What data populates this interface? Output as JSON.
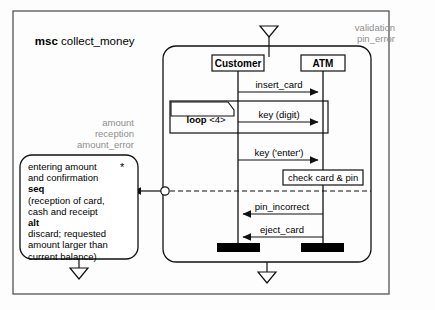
{
  "diagram": {
    "type": "message-sequence-chart",
    "keyword": "msc",
    "name": "collect_money",
    "title_full": "msc collect_money"
  },
  "gates": {
    "top_right_labels": [
      "validation",
      "pin_error"
    ],
    "left_labels": [
      "amount",
      "reception",
      "amount_error"
    ],
    "top_gate_name": "top-gate-triangle",
    "bottom_gate_name": "bottom-gate-triangle",
    "reference_gate_name": "reference-gate-triangle",
    "circle_gate_name": "condition-circle-gate"
  },
  "instances": [
    {
      "name": "Customer",
      "id": "customer"
    },
    {
      "name": "ATM",
      "id": "atm"
    }
  ],
  "inline_expression": {
    "operator": "loop",
    "bound": "<4>",
    "label": "loop <4>"
  },
  "messages": [
    {
      "label": "insert_card",
      "from": "Customer",
      "to": "ATM",
      "direction": "right"
    },
    {
      "label": "key (digit)",
      "from": "Customer",
      "to": "ATM",
      "direction": "right"
    },
    {
      "label": "key ('enter')",
      "from": "Customer",
      "to": "ATM",
      "direction": "right"
    },
    {
      "label": "pin_incorrect",
      "from": "ATM",
      "to": "Customer",
      "direction": "left"
    },
    {
      "label": "eject_card",
      "from": "ATM",
      "to": "Customer",
      "direction": "left"
    }
  ],
  "action": {
    "label": "check card & pin",
    "on": "ATM"
  },
  "reference": {
    "star": "*",
    "lines": [
      "entering amount",
      "and confirmation",
      "seq",
      "(reception of card,",
      "cash and receipt",
      "alt",
      "discard; requested",
      "amount larger than",
      "current balance)"
    ],
    "bold_lines": [
      "seq",
      "alt"
    ],
    "text_plain": "entering amount and confirmation seq (reception of card, cash and receipt alt discard; requested amount larger than current balance)"
  },
  "colors": {
    "stroke": "#1a1a1a",
    "gray_text": "#8d8d8d",
    "frame": "#4a4a4a",
    "background": "#fdfdfd",
    "termination_fill": "#000000"
  }
}
